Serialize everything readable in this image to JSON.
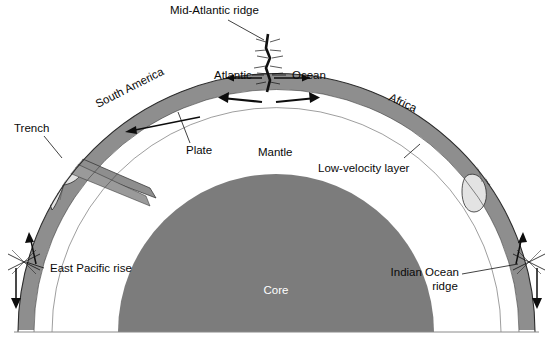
{
  "figure": {
    "title_visible": false,
    "background": "#ffffff",
    "width": 553,
    "height": 338
  },
  "colors": {
    "continent_fill": "#e3e3e3",
    "plate_fill": "#8e8e8e",
    "core_fill": "#7c7c7c",
    "mantle_fill": "#ffffff",
    "outline": "#2b2b2b",
    "label_text": "#0a0a0a",
    "core_label_text": "#ffffff",
    "leader_line": "#111111"
  },
  "labels": {
    "mid_atlantic_ridge": "Mid-Atlantic ridge",
    "atlantic": "Atlantic",
    "ocean": "Ocean",
    "south_america": "South America",
    "africa": "Africa",
    "trench": "Trench",
    "plate": "Plate",
    "mantle": "Mantle",
    "low_velocity_layer": "Low-velocity layer",
    "east_pacific_rise": "East Pacific rise",
    "indian_ocean_ridge_line1": "Indian Ocean",
    "indian_ocean_ridge_line2": "ridge",
    "core": "Core"
  },
  "diagram": {
    "type": "cross-section",
    "layers": [
      {
        "name": "crust-continent",
        "label": "South America / Africa",
        "fill": "#e3e3e3"
      },
      {
        "name": "lithospheric-plate",
        "label": "Plate",
        "fill": "#8e8e8e"
      },
      {
        "name": "low-velocity-layer",
        "label": "Low-velocity layer",
        "fill": "#ffffff"
      },
      {
        "name": "mantle",
        "label": "Mantle",
        "fill": "#ffffff"
      },
      {
        "name": "core",
        "label": "Core",
        "fill": "#7c7c7c"
      }
    ],
    "features": [
      {
        "name": "Mid-Atlantic ridge",
        "type": "spreading-center",
        "position": "top-center"
      },
      {
        "name": "Trench",
        "type": "subduction-zone",
        "position": "left"
      },
      {
        "name": "East Pacific rise",
        "type": "spreading-center",
        "position": "bottom-left"
      },
      {
        "name": "Indian Ocean ridge",
        "type": "spreading-center",
        "position": "bottom-right"
      }
    ],
    "motion_arrows": [
      {
        "name": "plate-motion-west",
        "direction": "left",
        "region": "South American plate"
      },
      {
        "name": "plate-motion-east",
        "direction": "right",
        "region": "African plate"
      },
      {
        "name": "ridge-divergence-left",
        "direction": "left",
        "region": "Mid-Atlantic ridge"
      },
      {
        "name": "ridge-divergence-right",
        "direction": "right",
        "region": "Mid-Atlantic ridge"
      },
      {
        "name": "east-pacific-rise-down",
        "direction": "down",
        "region": "East Pacific rise"
      },
      {
        "name": "east-pacific-rise-up",
        "direction": "up",
        "region": "East Pacific rise"
      },
      {
        "name": "indian-ridge-up",
        "direction": "up",
        "region": "Indian Ocean ridge"
      },
      {
        "name": "indian-ridge-down",
        "direction": "down",
        "region": "Indian Ocean ridge"
      }
    ]
  }
}
